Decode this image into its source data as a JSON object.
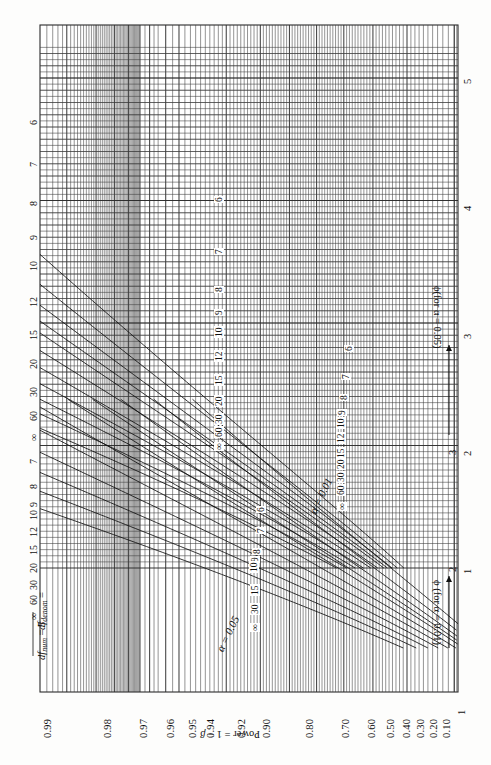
{
  "figure": {
    "kind": "pearson-hartley-power-curves",
    "orientation": "rotated-90-ccw",
    "df_num_label": "df",
    "df_num_sub": "num",
    "df_num_value": " = 5",
    "df_denom_label": "df",
    "df_denom_sub": "denom",
    "df_denom_value": " =",
    "alpha05_label": "α = 0.05",
    "alpha01_label": "α = 0.01",
    "power_axis_title_a": "Power = 1 − ",
    "power_axis_title_b": "β",
    "phi01_axis_title": "ϕ (for α = 0.01)",
    "phi05_axis_title": "ϕ(for α = 0.05)"
  },
  "chart_data": {
    "type": "line",
    "xlabel": "Power = 1 − β",
    "ylabel": "ϕ (noncentrality parameter)",
    "grid": true,
    "legend": "inline curve labels",
    "power_axis": {
      "name": "Power = 1 - beta",
      "scale": "normal-probability",
      "ticks": [
        "0.99",
        "0.98",
        "0.97",
        "0.96",
        "0.95",
        "0.94",
        "0.92",
        "0.90",
        "0.80",
        "0.70",
        "0.60",
        "0.50",
        "0.40",
        "0.30",
        "0.20",
        "0.10"
      ],
      "values": [
        0.99,
        0.98,
        0.97,
        0.96,
        0.95,
        0.94,
        0.92,
        0.9,
        0.8,
        0.7,
        0.6,
        0.5,
        0.4,
        0.3,
        0.2,
        0.1
      ],
      "range": [
        0.1,
        0.995
      ]
    },
    "phi_axis_alpha_01": {
      "name": "phi (for alpha = 0.01)",
      "ticks": [
        "1",
        "2",
        "3"
      ],
      "values": [
        1,
        2,
        3
      ],
      "range": [
        1,
        3.4
      ]
    },
    "phi_axis_alpha_05": {
      "name": "phi (for alpha = 0.05)",
      "ticks": [
        "1",
        "2",
        "3",
        "4",
        "5"
      ],
      "values": [
        1,
        2,
        3,
        4,
        5
      ],
      "range": [
        1,
        5.2
      ]
    },
    "families": [
      {
        "name": "alpha = 0.05",
        "alpha": 0.05,
        "curve_labels": [
          "6",
          "7",
          "8",
          "9",
          "10",
          "12",
          "15",
          "20",
          "30",
          "60",
          "∞"
        ],
        "df_denom": [
          6,
          7,
          8,
          9,
          10,
          12,
          15,
          20,
          30,
          60,
          "inf"
        ]
      },
      {
        "name": "alpha = 0.01",
        "alpha": 0.01,
        "curve_labels": [
          "6",
          "7",
          "8",
          "9",
          "10",
          "12",
          "15",
          "20",
          "30",
          "60",
          "∞"
        ],
        "df_denom": [
          6,
          7,
          8,
          9,
          10,
          12,
          15,
          20,
          30,
          60,
          "inf"
        ]
      }
    ],
    "left_edge_curve_labels_alpha05": [
      "6",
      "7",
      "8",
      "9",
      "10",
      "12",
      "15",
      "20",
      "30",
      "60",
      "∞"
    ],
    "left_edge_curve_labels_alpha01": [
      "7",
      "8",
      "9",
      "10",
      "12",
      "15",
      "20",
      "30",
      "60",
      "∞"
    ],
    "mid_curve_labels_alpha05": [
      "6",
      "7",
      "8",
      "9",
      "10",
      "12",
      "15",
      "20",
      "30",
      "60",
      "∞"
    ],
    "mid_curve_labels_alpha01": [
      "6",
      "7",
      "8",
      "9",
      "10",
      "12",
      "15",
      "20",
      "30",
      "60",
      "∞"
    ],
    "inner_curve_labels_alpha05": [
      "6",
      "7",
      "8",
      "9",
      "10",
      "15",
      "30",
      "∞"
    ],
    "inner_curve_labels_alpha01": [
      "6",
      "7",
      "8",
      "9",
      "10",
      "12",
      "15",
      "20",
      "30",
      "60",
      "∞"
    ]
  },
  "power_ticks": [
    {
      "t": "0.99",
      "x": 38
    },
    {
      "t": "0.98",
      "x": 98
    },
    {
      "t": "0.97",
      "x": 134
    },
    {
      "t": "0.96",
      "x": 161
    },
    {
      "t": "0.95",
      "x": 183
    },
    {
      "t": "0.94",
      "x": 201
    },
    {
      "t": "0.92",
      "x": 232
    },
    {
      "t": "0.90",
      "x": 257
    },
    {
      "t": "0.80",
      "x": 300
    },
    {
      "t": "0.70",
      "x": 336
    },
    {
      "t": "0.60",
      "x": 362
    },
    {
      "t": "0.50",
      "x": 381
    },
    {
      "t": "0.40",
      "x": 397
    },
    {
      "t": "0.30",
      "x": 411
    },
    {
      "t": "0.20",
      "x": 424
    },
    {
      "t": "0.10",
      "x": 437
    }
  ],
  "phi05_ticks": [
    {
      "t": "5",
      "y": 78
    },
    {
      "t": "4",
      "y": 205
    },
    {
      "t": "3",
      "y": 333
    },
    {
      "t": "2",
      "y": 450
    },
    {
      "t": "1",
      "y": 568
    }
  ],
  "phi01_ticks": [
    {
      "t": "3",
      "y": 449
    },
    {
      "t": "2",
      "y": 566
    }
  ],
  "edge_labels": [
    {
      "t": "6",
      "y": 118
    },
    {
      "t": "7",
      "y": 160
    },
    {
      "t": "8",
      "y": 199
    },
    {
      "t": "9",
      "y": 233
    },
    {
      "t": "10",
      "y": 264
    },
    {
      "t": "12",
      "y": 300
    },
    {
      "t": "15",
      "y": 333
    },
    {
      "t": "20",
      "y": 362
    },
    {
      "t": "30",
      "y": 390
    },
    {
      "t": "60",
      "y": 414
    },
    {
      "t": "∞",
      "y": 434
    },
    {
      "t": "7",
      "y": 457
    },
    {
      "t": "8",
      "y": 482
    },
    {
      "t": "9",
      "y": 500
    },
    {
      "t": "10",
      "y": 513
    },
    {
      "t": "12",
      "y": 530
    },
    {
      "t": "15",
      "y": 548
    },
    {
      "t": "20",
      "y": 566
    },
    {
      "t": "30",
      "y": 583
    },
    {
      "t": "60",
      "y": 598
    },
    {
      "t": "∞",
      "y": 613
    }
  ],
  "mid_labels": [
    {
      "t": "6",
      "x": 214,
      "y": 196
    },
    {
      "t": "7",
      "x": 214,
      "y": 248
    },
    {
      "t": "8",
      "x": 214,
      "y": 286
    },
    {
      "t": "9",
      "x": 214,
      "y": 309
    },
    {
      "t": "10",
      "x": 214,
      "y": 331
    },
    {
      "t": "12",
      "x": 214,
      "y": 355
    },
    {
      "t": "15",
      "x": 214,
      "y": 379
    },
    {
      "t": "20",
      "x": 214,
      "y": 400
    },
    {
      "t": "30",
      "x": 214,
      "y": 418
    },
    {
      "t": "60",
      "x": 214,
      "y": 431
    },
    {
      "t": "∞",
      "x": 214,
      "y": 444
    }
  ],
  "inner05_labels": [
    {
      "t": "6",
      "x": 256,
      "y": 506
    },
    {
      "t": "7",
      "x": 256,
      "y": 527
    },
    {
      "t": "8",
      "x": 252,
      "y": 548
    },
    {
      "t": "9",
      "x": 250,
      "y": 556
    },
    {
      "t": "10",
      "x": 249,
      "y": 566
    },
    {
      "t": "15",
      "x": 250,
      "y": 589
    },
    {
      "t": "30",
      "x": 250,
      "y": 608
    },
    {
      "t": "∞",
      "x": 250,
      "y": 625
    }
  ],
  "inner01_labels": [
    {
      "t": "6",
      "x": 344,
      "y": 345
    },
    {
      "t": "7",
      "x": 341,
      "y": 373
    },
    {
      "t": "8",
      "x": 339,
      "y": 394
    },
    {
      "t": "9",
      "x": 337,
      "y": 409
    },
    {
      "t": "10",
      "x": 336,
      "y": 422
    },
    {
      "t": "12",
      "x": 336,
      "y": 437
    },
    {
      "t": "15",
      "x": 336,
      "y": 452
    },
    {
      "t": "20",
      "x": 336,
      "y": 463
    },
    {
      "t": "30",
      "x": 336,
      "y": 476
    },
    {
      "t": "60",
      "x": 336,
      "y": 489
    },
    {
      "t": "∞",
      "x": 337,
      "y": 504
    }
  ]
}
